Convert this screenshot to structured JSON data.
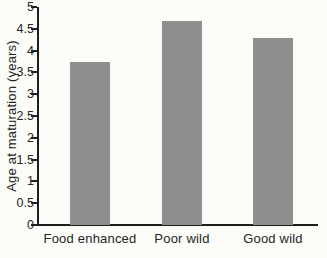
{
  "chart_data": {
    "type": "bar",
    "title": "",
    "xlabel": "",
    "ylabel": "Age at maturation (years)",
    "categories": [
      "Food enhanced",
      "Poor wild",
      "Good wild"
    ],
    "values": [
      3.73,
      4.68,
      4.3
    ],
    "ylim": [
      0,
      5
    ],
    "ytick_step": 0.5,
    "ytick_labels": [
      "0",
      "0.5",
      "1",
      "1.5",
      "2",
      "2.5",
      "3",
      "3.5",
      "4",
      "4.5",
      "5"
    ],
    "grid": false,
    "legend_position": "none",
    "colors": {
      "bar": "#8e8e8e",
      "axis": "#1e1e1e",
      "text": "#262626",
      "background": "#fbfbf8"
    }
  }
}
